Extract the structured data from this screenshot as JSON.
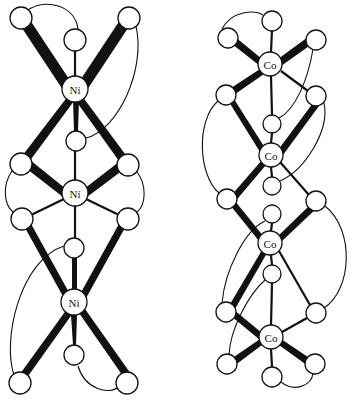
{
  "figure": {
    "left_structure": {
      "name": "nickel trimer",
      "metal_label": "Ni",
      "metal_centers": [
        {
          "label": "Ni",
          "x": 75,
          "y": 89
        },
        {
          "label": "Ni",
          "x": 75,
          "y": 193
        },
        {
          "label": "Ni",
          "x": 74,
          "y": 302
        }
      ],
      "ligand_atoms": [
        {
          "x": 21,
          "y": 18
        },
        {
          "x": 75,
          "y": 40
        },
        {
          "x": 129,
          "y": 18
        },
        {
          "x": 76,
          "y": 141
        },
        {
          "x": 21,
          "y": 164
        },
        {
          "x": 128,
          "y": 165
        },
        {
          "x": 22,
          "y": 219
        },
        {
          "x": 128,
          "y": 219
        },
        {
          "x": 74,
          "y": 248
        },
        {
          "x": 74,
          "y": 355
        },
        {
          "x": 20,
          "y": 383
        },
        {
          "x": 127,
          "y": 383
        }
      ]
    },
    "right_structure": {
      "name": "cobalt tetramer",
      "metal_label": "Co",
      "metal_centers": [
        {
          "label": "Co",
          "x": 270,
          "y": 64
        },
        {
          "label": "Co",
          "x": 271,
          "y": 155
        },
        {
          "label": "Co",
          "x": 270,
          "y": 243
        },
        {
          "label": "Co",
          "x": 271,
          "y": 337
        }
      ],
      "ligand_atoms": [
        {
          "x": 228,
          "y": 38
        },
        {
          "x": 272,
          "y": 21
        },
        {
          "x": 316,
          "y": 40
        },
        {
          "x": 226,
          "y": 95
        },
        {
          "x": 316,
          "y": 96
        },
        {
          "x": 272,
          "y": 124
        },
        {
          "x": 272,
          "y": 186
        },
        {
          "x": 227,
          "y": 199
        },
        {
          "x": 316,
          "y": 201
        },
        {
          "x": 272,
          "y": 214
        },
        {
          "x": 272,
          "y": 274
        },
        {
          "x": 226,
          "y": 312
        },
        {
          "x": 316,
          "y": 313
        },
        {
          "x": 227,
          "y": 364
        },
        {
          "x": 315,
          "y": 364
        },
        {
          "x": 272,
          "y": 377
        }
      ]
    },
    "labels": {
      "ni1": "Ni",
      "ni2": "Ni",
      "ni3": "Ni",
      "co1": "Co",
      "co2": "Co",
      "co3": "Co",
      "co4": "Co"
    },
    "colors": {
      "ink": "#111111",
      "paper": "#ffffff"
    }
  }
}
